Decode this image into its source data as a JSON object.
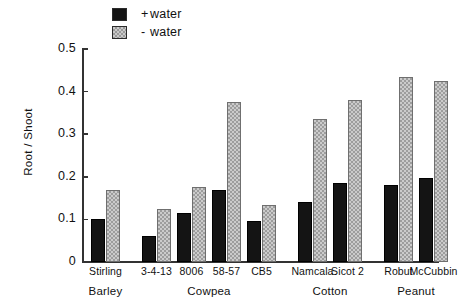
{
  "chart_data": {
    "type": "bar",
    "title": "",
    "xlabel": "",
    "ylabel": "Root / Shoot",
    "ylim": [
      0,
      0.5
    ],
    "ytick_labels": [
      "0.5",
      "0.4",
      "0.3",
      "0.2",
      "0.1",
      "0"
    ],
    "ytick_values": [
      0.5,
      0.4,
      0.3,
      0.2,
      0.1,
      0
    ],
    "grid": false,
    "legend_position": "top-left",
    "categories": [
      "Stirling",
      "3-4-13",
      "8006",
      "58-57",
      "CB5",
      "Namcala",
      "Sicot 2",
      "Robut",
      "McCubbin"
    ],
    "groups": [
      {
        "name": "Barley",
        "categories": [
          "Stirling"
        ]
      },
      {
        "name": "Cowpea",
        "categories": [
          "3-4-13",
          "8006",
          "58-57",
          "CB5"
        ]
      },
      {
        "name": "Cotton",
        "categories": [
          "Namcala",
          "Sicot 2"
        ]
      },
      {
        "name": "Peanut",
        "categories": [
          "Robut",
          "McCubbin"
        ]
      }
    ],
    "series": [
      {
        "name": "+ water",
        "color": "#141414",
        "values": [
          0.1,
          0.06,
          0.115,
          0.17,
          0.097,
          0.14,
          0.185,
          0.18,
          0.197
        ]
      },
      {
        "name": "- water",
        "color": "#cbcbcb",
        "values": [
          0.17,
          0.125,
          0.175,
          0.375,
          0.135,
          0.335,
          0.38,
          0.435,
          0.425
        ]
      }
    ]
  },
  "legend": {
    "entries": [
      {
        "sign": "+",
        "label": "water",
        "swatch": "plus"
      },
      {
        "sign": "-",
        "label": "water",
        "swatch": "minus"
      }
    ]
  },
  "axis": {
    "y_title": "Root / Shoot"
  }
}
